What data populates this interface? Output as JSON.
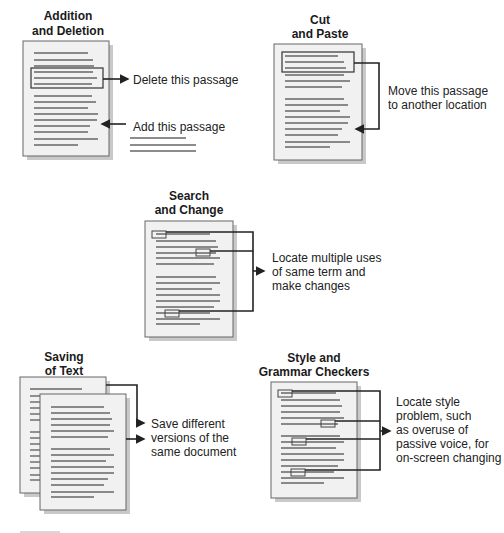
{
  "figure": {
    "panels": [
      {
        "id": "addition-deletion",
        "title_lines": [
          "Addition",
          "and Deletion"
        ],
        "annotations": [
          "Delete this passage",
          "Add this passage"
        ]
      },
      {
        "id": "cut-paste",
        "title_lines": [
          "Cut",
          "and Paste"
        ],
        "annotations": [
          "Move this passage",
          "to another location"
        ]
      },
      {
        "id": "search-change",
        "title_lines": [
          "Search",
          "and Change"
        ],
        "annotations": [
          "Locate multiple uses",
          "of same term and",
          "make changes"
        ]
      },
      {
        "id": "saving-text",
        "title_lines": [
          "Saving",
          "of Text"
        ],
        "annotations": [
          "Save different",
          "versions of the",
          "same document"
        ]
      },
      {
        "id": "style-grammar",
        "title_lines": [
          "Style and",
          "Grammar Checkers"
        ],
        "annotations": [
          "Locate style",
          "problem, such",
          "as overuse of",
          "passive voice, for",
          "on-screen changing"
        ]
      }
    ]
  }
}
